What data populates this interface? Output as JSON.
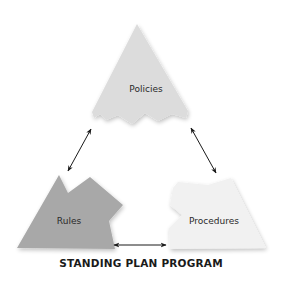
{
  "diagram": {
    "title": "STANDING PLAN PROGRAM",
    "nodes": [
      {
        "id": "policies",
        "label": "Policies",
        "fill": "#dcdcdc"
      },
      {
        "id": "rules",
        "label": "Rules",
        "fill": "#a8a8a8"
      },
      {
        "id": "procedures",
        "label": "Procedures",
        "fill": "#f1f1f1"
      }
    ],
    "edges": [
      {
        "from": "policies",
        "to": "rules",
        "type": "bidirectional"
      },
      {
        "from": "policies",
        "to": "procedures",
        "type": "bidirectional"
      },
      {
        "from": "rules",
        "to": "procedures",
        "type": "bidirectional"
      }
    ],
    "colors": {
      "background": "#ffffff",
      "arrow": "#1a1a1a",
      "text": "#2a2a2a"
    }
  }
}
